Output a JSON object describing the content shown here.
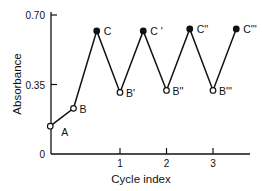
{
  "chart_data": {
    "type": "line",
    "title": "",
    "xlabel": "Cycle index",
    "ylabel": "Absorbance",
    "xlim": [
      -0.5,
      3.5
    ],
    "ylim": [
      0,
      0.7
    ],
    "x_ticks": [
      1,
      2,
      3
    ],
    "x_tick_labels": [
      "1",
      "2",
      "3"
    ],
    "y_ticks": [
      0,
      0.35,
      0.7
    ],
    "y_tick_labels": [
      "0",
      "0.35",
      "0.70"
    ],
    "grid": false,
    "legend": null,
    "series": [
      {
        "name": "Absorbance",
        "points": [
          {
            "label": "A",
            "x": -0.5,
            "y": 0.14,
            "marker": "open"
          },
          {
            "label": "B",
            "x": 0.0,
            "y": 0.23,
            "marker": "open"
          },
          {
            "label": "C",
            "x": 0.5,
            "y": 0.62,
            "marker": "filled"
          },
          {
            "label": "B'",
            "x": 1.0,
            "y": 0.31,
            "marker": "open"
          },
          {
            "label": "C '",
            "x": 1.5,
            "y": 0.62,
            "marker": "filled"
          },
          {
            "label": "B''",
            "x": 2.0,
            "y": 0.32,
            "marker": "open"
          },
          {
            "label": "C''",
            "x": 2.5,
            "y": 0.63,
            "marker": "filled"
          },
          {
            "label": "B'''",
            "x": 3.0,
            "y": 0.32,
            "marker": "open"
          },
          {
            "label": "C'''",
            "x": 3.5,
            "y": 0.63,
            "marker": "filled"
          }
        ]
      }
    ]
  }
}
